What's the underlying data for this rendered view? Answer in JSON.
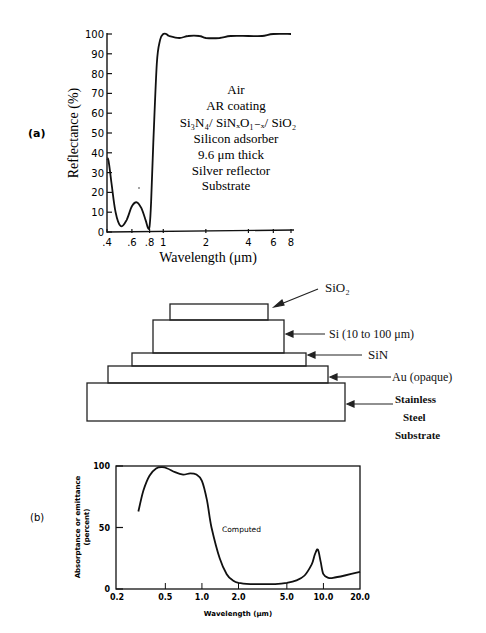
{
  "panel_a": {
    "label": "(a)",
    "ylabel": "Reflectance (%)",
    "xlabel": "Wavelength (μm)",
    "yticks": [
      "0",
      "10",
      "20",
      "30",
      "40",
      "50",
      "60",
      "70",
      "80",
      "90",
      "100"
    ],
    "xticks": [
      ".4",
      ".6",
      ".8",
      "1",
      "2",
      "4",
      "6",
      "8"
    ],
    "legend_lines": [
      "Air",
      "AR coating",
      "Si₃N₄/ SiNₓO₁₋ₓ/ SiO₂",
      "Silicon adsorber",
      "9.6 μm thick",
      "Silver reflector",
      "Substrate"
    ]
  },
  "diagram": {
    "layers": [
      {
        "name": "SiO2",
        "label": "SiO₂"
      },
      {
        "name": "Si",
        "label": "Si (10 to 100 μm)"
      },
      {
        "name": "SiN",
        "label": "SiN"
      },
      {
        "name": "Au",
        "label": "Au (opaque)"
      },
      {
        "name": "Steel",
        "label_lines": [
          "Stainless",
          "Steel",
          "Substrate"
        ]
      }
    ]
  },
  "panel_b": {
    "label": "(b)",
    "ylabel_lines": [
      "Absorptance or emittance",
      "(percent)"
    ],
    "xlabel": "Wavelength (μm)",
    "yticks": [
      "0",
      "50",
      "100"
    ],
    "xticks": [
      "0.2",
      "0.5",
      "1.0",
      "2.0",
      "5.0",
      "10.0",
      "20.0"
    ],
    "annotation": "Computed"
  },
  "chart_data": [
    {
      "type": "line",
      "title": "",
      "xlabel": "Wavelength (μm)",
      "ylabel": "Reflectance (%)",
      "xscale": "log",
      "xlim": [
        0.4,
        8
      ],
      "ylim": [
        0,
        100
      ],
      "x_ticks": [
        0.4,
        0.6,
        0.8,
        1,
        2,
        4,
        6,
        8
      ],
      "y_ticks": [
        0,
        10,
        20,
        30,
        40,
        50,
        60,
        70,
        80,
        90,
        100
      ],
      "grid": false,
      "series": [
        {
          "name": "Reflectance",
          "x": [
            0.4,
            0.41,
            0.43,
            0.46,
            0.5,
            0.55,
            0.6,
            0.65,
            0.7,
            0.75,
            0.78,
            0.8,
            0.82,
            0.85,
            0.9,
            0.95,
            1.0,
            1.05,
            1.1,
            1.3,
            1.5,
            1.8,
            2.0,
            2.5,
            3,
            4,
            5,
            6,
            8
          ],
          "y": [
            37,
            36,
            25,
            10,
            3,
            6,
            13,
            15,
            12,
            6,
            2,
            3,
            15,
            45,
            85,
            97,
            100,
            100,
            99,
            98,
            99,
            99,
            98,
            98,
            99,
            99,
            99,
            100,
            100
          ]
        }
      ],
      "annotations": [
        "Air",
        "AR coating",
        "Si3N4/ SiNxO1-x/ SiO2",
        "Silicon adsorber",
        "9.6 μm thick",
        "Silver reflector",
        "Substrate"
      ]
    },
    {
      "type": "line",
      "title": "",
      "xlabel": "Wavelength (μm)",
      "ylabel": "Absorptance or emittance (percent)",
      "xscale": "log",
      "xlim": [
        0.2,
        20
      ],
      "ylim": [
        0,
        100
      ],
      "x_ticks": [
        0.2,
        0.5,
        1.0,
        2.0,
        5.0,
        10.0,
        20.0
      ],
      "y_ticks": [
        0,
        50,
        100
      ],
      "grid": false,
      "series": [
        {
          "name": "Computed",
          "x": [
            0.3,
            0.33,
            0.37,
            0.42,
            0.47,
            0.52,
            0.6,
            0.7,
            0.8,
            0.9,
            1.0,
            1.1,
            1.2,
            1.4,
            1.6,
            1.8,
            2.0,
            2.5,
            3,
            4,
            5,
            6,
            7,
            8,
            8.5,
            9,
            9.5,
            10,
            11,
            12,
            15,
            20
          ],
          "y": [
            63,
            80,
            92,
            98,
            99,
            98,
            95,
            93,
            94,
            93,
            88,
            72,
            50,
            25,
            12,
            7,
            5,
            4,
            4,
            4,
            5,
            7,
            11,
            20,
            28,
            32,
            22,
            12,
            9,
            9,
            11,
            14
          ]
        }
      ],
      "annotations": [
        "Computed"
      ]
    }
  ]
}
